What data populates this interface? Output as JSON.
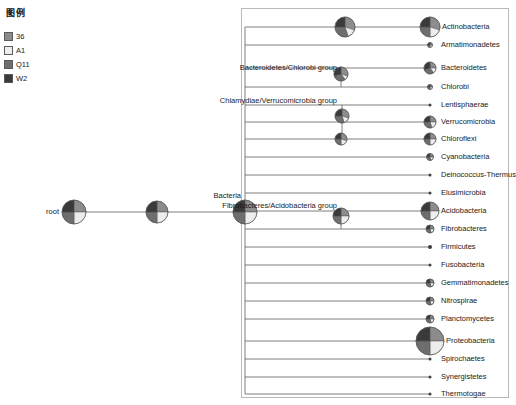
{
  "legend": {
    "title": "图例",
    "items": [
      {
        "label": "36",
        "color": "#8c8c8c"
      },
      {
        "label": "A1",
        "color": "#ededed"
      },
      {
        "label": "Q11",
        "color": "#6e6e6e"
      },
      {
        "label": "W2",
        "color": "#3a3a3a"
      }
    ]
  },
  "chart_data": {
    "type": "tree",
    "sample_names": [
      "36",
      "A1",
      "Q11",
      "W2"
    ],
    "sample_colors": [
      "#8c8c8c",
      "#ededed",
      "#6e6e6e",
      "#3a3a3a"
    ],
    "root": {
      "name": "root",
      "x": 74,
      "y": 212,
      "radius": 12,
      "fractions": [
        0.25,
        0.25,
        0.25,
        0.25
      ]
    },
    "spine_x": 245,
    "internal_nodes": [
      {
        "name": "",
        "x": 157,
        "y": 212,
        "radius": 11,
        "fractions": [
          0.25,
          0.25,
          0.25,
          0.25
        ]
      },
      {
        "name": "Bacteria",
        "label_x": 241,
        "label_y": 196,
        "x": 245,
        "y": 212,
        "radius": 12,
        "fractions": [
          0.25,
          0.25,
          0.25,
          0.25
        ]
      },
      {
        "name": "Bacteroidetes/Chlorobi group",
        "label_x": 337,
        "label_y": 68,
        "x": 341,
        "y": 74,
        "radius": 7,
        "fractions": [
          0.3,
          0.1,
          0.3,
          0.3
        ]
      },
      {
        "name": "Chlamydiae/Verrucomicrobia group",
        "label_x": 337,
        "label_y": 101,
        "x": 342,
        "y": 116,
        "radius": 7,
        "fractions": [
          0.3,
          0.15,
          0.3,
          0.25
        ]
      },
      {
        "name": "Fibrobacteres/Acidobacteria group",
        "label_x": 337,
        "label_y": 206,
        "x": 341,
        "y": 216,
        "radius": 8,
        "fractions": [
          0.25,
          0.25,
          0.25,
          0.25
        ]
      },
      {
        "name": "",
        "x": 341,
        "y": 139,
        "radius": 6,
        "fractions": [
          0.3,
          0.2,
          0.25,
          0.25
        ]
      },
      {
        "name": "",
        "x": 345,
        "y": 27,
        "radius": 10,
        "fractions": [
          0.3,
          0.15,
          0.3,
          0.25
        ]
      }
    ],
    "leaves": [
      {
        "name": "Actinobacteria",
        "y": 27,
        "radius": 10,
        "fractions": [
          0.3,
          0.2,
          0.25,
          0.25
        ]
      },
      {
        "name": "Armatimonadetes",
        "y": 45,
        "radius": 2.5,
        "fractions": [
          0.25,
          0.25,
          0.25,
          0.25
        ]
      },
      {
        "name": "Bacteroidetes",
        "y": 68,
        "radius": 6,
        "fractions": [
          0.25,
          0.15,
          0.3,
          0.3
        ]
      },
      {
        "name": "Chlorobi",
        "y": 87,
        "radius": 2.5,
        "fractions": [
          0.25,
          0.25,
          0.25,
          0.25
        ]
      },
      {
        "name": "Lentisphaerae",
        "y": 105,
        "radius": 1.5,
        "fractions": [
          0.25,
          0.25,
          0.25,
          0.25
        ]
      },
      {
        "name": "Verrucomicrobia",
        "y": 122,
        "radius": 6,
        "fractions": [
          0.25,
          0.2,
          0.3,
          0.25
        ]
      },
      {
        "name": "Chloroflexi",
        "y": 139,
        "radius": 6,
        "fractions": [
          0.25,
          0.25,
          0.25,
          0.25
        ]
      },
      {
        "name": "Cyanobacteria",
        "y": 157,
        "radius": 3.5,
        "fractions": [
          0.25,
          0.2,
          0.3,
          0.25
        ]
      },
      {
        "name": "Deinococcus-Thermus",
        "y": 175,
        "radius": 1.5,
        "fractions": [
          0.25,
          0.25,
          0.25,
          0.25
        ]
      },
      {
        "name": "Elusimicrobia",
        "y": 193,
        "radius": 1.5,
        "fractions": [
          0.25,
          0.25,
          0.25,
          0.25
        ]
      },
      {
        "name": "Acidobacteria",
        "y": 211,
        "radius": 9,
        "fractions": [
          0.25,
          0.25,
          0.25,
          0.25
        ]
      },
      {
        "name": "Fibrobacteres",
        "y": 229,
        "radius": 4,
        "fractions": [
          0.25,
          0.2,
          0.3,
          0.25
        ]
      },
      {
        "name": "Firmicutes",
        "y": 247,
        "radius": 2,
        "fractions": [
          0.25,
          0.25,
          0.25,
          0.25
        ]
      },
      {
        "name": "Fusobacteria",
        "y": 265,
        "radius": 1.5,
        "fractions": [
          0.25,
          0.25,
          0.25,
          0.25
        ]
      },
      {
        "name": "Gemmatimonadetes",
        "y": 283,
        "radius": 4,
        "fractions": [
          0.25,
          0.2,
          0.3,
          0.25
        ]
      },
      {
        "name": "Nitrospirae",
        "y": 301,
        "radius": 4,
        "fractions": [
          0.25,
          0.2,
          0.3,
          0.25
        ]
      },
      {
        "name": "Planctomycetes",
        "y": 319,
        "radius": 4,
        "fractions": [
          0.25,
          0.2,
          0.3,
          0.25
        ]
      },
      {
        "name": "Proteobacteria",
        "y": 341,
        "radius": 14,
        "fractions": [
          0.25,
          0.25,
          0.25,
          0.25
        ]
      },
      {
        "name": "Spirochaetes",
        "y": 359,
        "radius": 1.5,
        "fractions": [
          0.25,
          0.25,
          0.25,
          0.25
        ]
      },
      {
        "name": "Synergistetes",
        "y": 377,
        "radius": 1.5,
        "fractions": [
          0.25,
          0.25,
          0.25,
          0.25
        ]
      },
      {
        "name": "Thermotogae",
        "y": 394,
        "radius": 1.5,
        "fractions": [
          0.25,
          0.25,
          0.25,
          0.25
        ]
      }
    ],
    "leaf_node_x": 430,
    "leaf_label_x": 441
  }
}
